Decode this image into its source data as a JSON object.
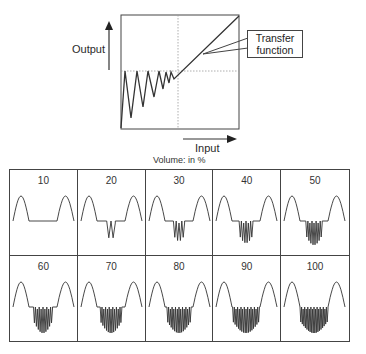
{
  "transfer_diagram": {
    "y_axis_label": "Output",
    "x_axis_label": "Input",
    "callout_line1": "Transfer",
    "callout_line2": "function",
    "caption": "Volume: in %"
  },
  "volume_panels": [
    {
      "label": "10",
      "level": 10
    },
    {
      "label": "20",
      "level": 20
    },
    {
      "label": "30",
      "level": 30
    },
    {
      "label": "40",
      "level": 40
    },
    {
      "label": "50",
      "level": 50
    },
    {
      "label": "60",
      "level": 60
    },
    {
      "label": "70",
      "level": 70
    },
    {
      "label": "80",
      "level": 80
    },
    {
      "label": "90",
      "level": 90
    },
    {
      "label": "100",
      "level": 100
    }
  ],
  "colors": {
    "line": "#333333",
    "dotted": "#888888",
    "background": "#ffffff"
  }
}
